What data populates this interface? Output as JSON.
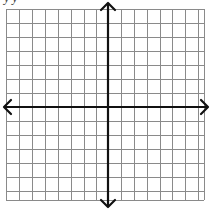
{
  "caption": {
    "text": "y  y",
    "note": "clipped text at top edge; only descenders visible"
  },
  "coordinate_plane": {
    "grid": {
      "left": 6,
      "top": 9,
      "right": 204,
      "bottom": 200,
      "vertical_lines_x": [
        6,
        19,
        32,
        45,
        58,
        71,
        84,
        96,
        121,
        134,
        147,
        160,
        172,
        185,
        198,
        204
      ],
      "horizontal_lines_y": [
        9,
        23,
        37,
        51,
        65,
        79,
        93,
        121,
        135,
        149,
        163,
        177,
        191,
        200
      ],
      "line_color": "#8a8a8a",
      "line_width": 1
    },
    "x_axis": {
      "y": 107,
      "x_start": 4,
      "x_end": 208,
      "color": "#111111",
      "width": 2.2,
      "arrows": [
        "left",
        "right"
      ]
    },
    "y_axis": {
      "x": 108,
      "y_start": 3,
      "y_end": 207,
      "color": "#111111",
      "width": 2.2,
      "arrows": [
        "up",
        "down"
      ]
    }
  }
}
